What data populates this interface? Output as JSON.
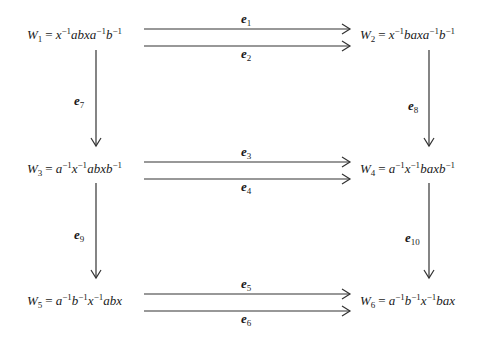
{
  "diagram": {
    "type": "commutative-diagram",
    "nodes": [
      {
        "id": "W1",
        "name": "W",
        "sub": "1",
        "rhs": "x^{-1}abxa^{-1}b^{-1}"
      },
      {
        "id": "W2",
        "name": "W",
        "sub": "2",
        "rhs": "x^{-1}baxa^{-1}b^{-1}"
      },
      {
        "id": "W3",
        "name": "W",
        "sub": "3",
        "rhs": "a^{-1}x^{-1}abxb^{-1}"
      },
      {
        "id": "W4",
        "name": "W",
        "sub": "4",
        "rhs": "a^{-1}x^{-1}baxb^{-1}"
      },
      {
        "id": "W5",
        "name": "W",
        "sub": "5",
        "rhs": "a^{-1}b^{-1}x^{-1}abx"
      },
      {
        "id": "W6",
        "name": "W",
        "sub": "6",
        "rhs": "a^{-1}b^{-1}x^{-1}bax"
      }
    ],
    "edges": [
      {
        "label": "e",
        "sub": "1",
        "from": "W1",
        "to": "W2"
      },
      {
        "label": "e",
        "sub": "2",
        "from": "W1",
        "to": "W2"
      },
      {
        "label": "e",
        "sub": "3",
        "from": "W3",
        "to": "W4"
      },
      {
        "label": "e",
        "sub": "4",
        "from": "W3",
        "to": "W4"
      },
      {
        "label": "e",
        "sub": "5",
        "from": "W5",
        "to": "W6"
      },
      {
        "label": "e",
        "sub": "6",
        "from": "W5",
        "to": "W6"
      },
      {
        "label": "e",
        "sub": "7",
        "from": "W1",
        "to": "W3"
      },
      {
        "label": "e",
        "sub": "8",
        "from": "W2",
        "to": "W4"
      },
      {
        "label": "e",
        "sub": "9",
        "from": "W3",
        "to": "W5"
      },
      {
        "label": "e",
        "sub": "10",
        "from": "W4",
        "to": "W6"
      }
    ]
  },
  "text": {
    "eq": "=",
    "inv": "−1",
    "W": "W",
    "e": "e",
    "s1": "1",
    "s2": "2",
    "s3": "3",
    "s4": "4",
    "s5": "5",
    "s6": "6",
    "s7": "7",
    "s8": "8",
    "s9": "9",
    "s10": "10",
    "x": "x",
    "a": "a",
    "b": "b",
    "abxa": "abxa",
    "baxa": "baxa",
    "abxb": "abxb",
    "baxb": "baxb",
    "abx": "abx",
    "bax": "bax"
  }
}
